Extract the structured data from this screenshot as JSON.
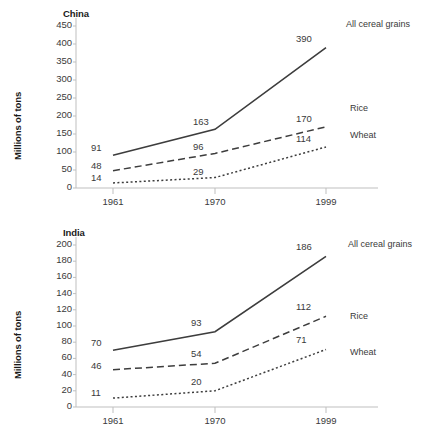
{
  "chart_data": [
    {
      "type": "line",
      "title": "China",
      "xlabel": "",
      "ylabel": "Millions of tons",
      "categories": [
        "1961",
        "1970",
        "1999"
      ],
      "ylim": [
        0,
        450
      ],
      "yticks": [
        "450",
        "400",
        "350",
        "300",
        "250",
        "200",
        "150",
        "100",
        "50",
        "0"
      ],
      "grid": false,
      "legend": "right-inline",
      "series": [
        {
          "name": "All cereal grains",
          "style": "solid",
          "values": [
            91,
            163,
            390
          ],
          "labels": [
            "91",
            "163",
            "390"
          ]
        },
        {
          "name": "Rice",
          "style": "dashed",
          "values": [
            48,
            96,
            170
          ],
          "labels": [
            "48",
            "96",
            "170"
          ]
        },
        {
          "name": "Wheat",
          "style": "dotted",
          "values": [
            14,
            29,
            114
          ],
          "labels": [
            "14",
            "29",
            "114"
          ]
        }
      ]
    },
    {
      "type": "line",
      "title": "India",
      "xlabel": "",
      "ylabel": "Millions of tons",
      "categories": [
        "1961",
        "1970",
        "1999"
      ],
      "ylim": [
        0,
        200
      ],
      "yticks": [
        "200",
        "180",
        "160",
        "140",
        "120",
        "100",
        "80",
        "60",
        "40",
        "20",
        "0"
      ],
      "grid": false,
      "legend": "right-inline",
      "series": [
        {
          "name": "All cereal grains",
          "style": "solid",
          "values": [
            70,
            93,
            186
          ],
          "labels": [
            "70",
            "93",
            "186"
          ]
        },
        {
          "name": "Rice",
          "style": "dashed",
          "values": [
            46,
            54,
            112
          ],
          "labels": [
            "46",
            "54",
            "112"
          ]
        },
        {
          "name": "Wheat",
          "style": "dotted",
          "values": [
            11,
            20,
            71
          ],
          "labels": [
            "11",
            "20",
            "71"
          ]
        }
      ]
    }
  ],
  "colors": {
    "line": "#3d3d3d",
    "axis": "#bfbfbf",
    "text": "#3a3a3a",
    "title": "#1a1a1a",
    "background": "#ffffff"
  }
}
